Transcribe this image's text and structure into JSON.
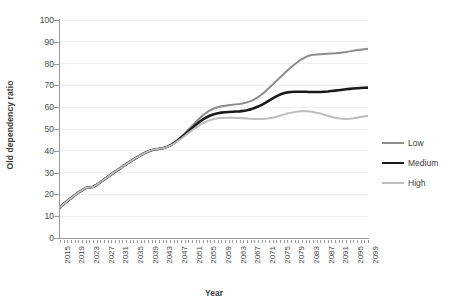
{
  "chart_data": {
    "type": "line",
    "title": "",
    "xlabel": "Year",
    "ylabel": "Old dependency ratio",
    "xlim": [
      2015,
      2099
    ],
    "ylim": [
      0,
      100
    ],
    "grid": true,
    "legend_position": "right",
    "y_ticks": [
      0,
      10,
      20,
      30,
      40,
      50,
      60,
      70,
      80,
      90,
      100
    ],
    "x_tick_labels": [
      "2015",
      "2019",
      "2023",
      "2027",
      "2031",
      "2035",
      "2039",
      "2043",
      "2047",
      "2051",
      "2055",
      "2059",
      "2063",
      "2067",
      "2071",
      "2075",
      "2079",
      "2083",
      "2087",
      "2091",
      "2095",
      "2099"
    ],
    "x": [
      2015,
      2016,
      2017,
      2018,
      2019,
      2020,
      2021,
      2022,
      2023,
      2024,
      2025,
      2026,
      2027,
      2028,
      2029,
      2030,
      2031,
      2032,
      2033,
      2034,
      2035,
      2036,
      2037,
      2038,
      2039,
      2040,
      2041,
      2042,
      2043,
      2044,
      2045,
      2046,
      2047,
      2048,
      2049,
      2050,
      2051,
      2052,
      2053,
      2054,
      2055,
      2056,
      2057,
      2058,
      2059,
      2060,
      2061,
      2062,
      2063,
      2064,
      2065,
      2066,
      2067,
      2068,
      2069,
      2070,
      2071,
      2072,
      2073,
      2074,
      2075,
      2076,
      2077,
      2078,
      2079,
      2080,
      2081,
      2082,
      2083,
      2084,
      2085,
      2086,
      2087,
      2088,
      2089,
      2090,
      2091,
      2092,
      2093,
      2094,
      2095,
      2096,
      2097,
      2098,
      2099
    ],
    "series": [
      {
        "name": "Low",
        "color": "#8c8c8c",
        "width": 2.0,
        "values": [
          14.0,
          15.6,
          17.0,
          18.3,
          19.6,
          20.8,
          21.9,
          22.9,
          23.2,
          23.4,
          24.4,
          25.6,
          26.8,
          28.0,
          29.2,
          30.4,
          31.5,
          32.7,
          33.8,
          34.9,
          36.0,
          37.0,
          38.0,
          38.9,
          39.7,
          40.3,
          40.7,
          40.9,
          41.2,
          41.7,
          42.5,
          43.6,
          44.9,
          46.4,
          48.0,
          49.7,
          51.4,
          53.1,
          54.8,
          56.3,
          57.6,
          58.6,
          59.4,
          60.0,
          60.4,
          60.7,
          60.9,
          61.1,
          61.3,
          61.5,
          61.8,
          62.2,
          62.8,
          63.6,
          64.6,
          65.8,
          67.2,
          68.8,
          70.4,
          72.0,
          73.6,
          75.2,
          76.8,
          78.3,
          79.7,
          81.0,
          82.1,
          83.0,
          83.7,
          84.0,
          84.2,
          84.3,
          84.4,
          84.5,
          84.6,
          84.7,
          84.9,
          85.1,
          85.3,
          85.6,
          85.9,
          86.2,
          86.4,
          86.6,
          86.8
        ]
      },
      {
        "name": "Medium",
        "color": "#1a1a1a",
        "width": 2.6,
        "values": [
          14.0,
          15.6,
          17.0,
          18.3,
          19.6,
          20.8,
          21.9,
          22.9,
          23.2,
          23.4,
          24.4,
          25.6,
          26.8,
          28.0,
          29.2,
          30.4,
          31.5,
          32.7,
          33.8,
          34.9,
          36.0,
          37.0,
          38.0,
          38.9,
          39.7,
          40.3,
          40.7,
          40.9,
          41.2,
          41.7,
          42.4,
          43.4,
          44.6,
          46.0,
          47.4,
          48.9,
          50.4,
          51.8,
          53.2,
          54.4,
          55.4,
          56.2,
          56.8,
          57.2,
          57.5,
          57.7,
          57.8,
          57.9,
          58.0,
          58.1,
          58.3,
          58.6,
          59.0,
          59.6,
          60.3,
          61.1,
          62.0,
          63.0,
          64.0,
          65.0,
          65.8,
          66.4,
          66.8,
          67.0,
          67.1,
          67.1,
          67.1,
          67.1,
          67.0,
          67.0,
          67.0,
          67.0,
          67.1,
          67.2,
          67.4,
          67.6,
          67.8,
          68.0,
          68.2,
          68.4,
          68.6,
          68.7,
          68.8,
          68.9,
          69.0
        ]
      },
      {
        "name": "High",
        "color": "#bdbdbd",
        "width": 2.0,
        "values": [
          14.0,
          15.6,
          17.0,
          18.3,
          19.6,
          20.8,
          21.9,
          22.9,
          23.2,
          23.4,
          24.4,
          25.6,
          26.8,
          28.0,
          29.2,
          30.4,
          31.5,
          32.7,
          33.8,
          34.9,
          36.0,
          37.0,
          38.0,
          38.9,
          39.7,
          40.3,
          40.7,
          40.9,
          41.2,
          41.7,
          42.3,
          43.2,
          44.3,
          45.5,
          46.8,
          48.1,
          49.4,
          50.6,
          51.7,
          52.7,
          53.5,
          54.1,
          54.6,
          54.9,
          55.1,
          55.2,
          55.2,
          55.2,
          55.1,
          55.0,
          54.9,
          54.8,
          54.7,
          54.6,
          54.6,
          54.6,
          54.7,
          54.9,
          55.2,
          55.6,
          56.1,
          56.6,
          57.1,
          57.5,
          57.8,
          58.0,
          58.1,
          58.1,
          58.0,
          57.8,
          57.5,
          57.1,
          56.6,
          56.1,
          55.6,
          55.2,
          54.9,
          54.7,
          54.6,
          54.7,
          54.9,
          55.2,
          55.5,
          55.8,
          56.0
        ]
      }
    ]
  },
  "legend": {
    "items": [
      {
        "label": "Low"
      },
      {
        "label": "Medium"
      },
      {
        "label": "High"
      }
    ]
  }
}
